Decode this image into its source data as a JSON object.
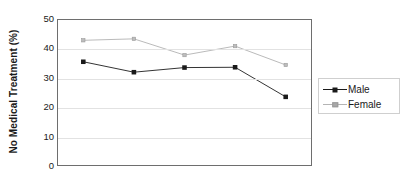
{
  "chart_data": {
    "type": "line",
    "title": "",
    "xlabel": "",
    "ylabel": "No Medical Treatment (%)",
    "ylim": [
      0,
      50
    ],
    "yticks": [
      0,
      10,
      20,
      30,
      40,
      50
    ],
    "ytick_labels": [
      "0",
      "10",
      "20",
      "30",
      "40",
      "50"
    ],
    "xtick_labels": [
      "",
      "",
      "",
      "",
      ""
    ],
    "x": [
      1,
      2,
      3,
      4,
      5
    ],
    "grid": "horizontal",
    "legend_position": "right",
    "series": [
      {
        "name": "Male",
        "values": [
          35.6,
          32.0,
          33.6,
          33.7,
          23.5
        ],
        "color": "#1a1a1a",
        "marker": "filled-square"
      },
      {
        "name": "Female",
        "values": [
          43.0,
          43.5,
          37.9,
          41.0,
          34.5
        ],
        "color": "#a8a8a8",
        "marker": "open-square"
      }
    ]
  },
  "legend": {
    "items": [
      {
        "label": "Male"
      },
      {
        "label": "Female"
      }
    ]
  },
  "axis": {
    "y_title": "No Medical Treatment (%)"
  }
}
